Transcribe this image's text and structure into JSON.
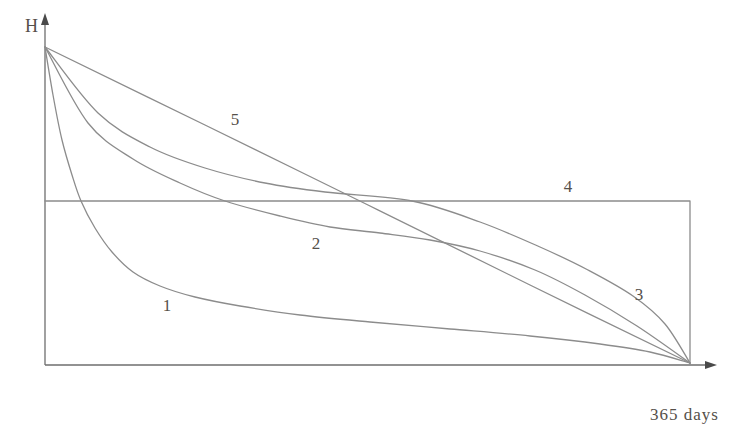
{
  "chart_data": {
    "type": "line",
    "title": "",
    "xlabel": "365 days",
    "ylabel": "H",
    "x_axis": {
      "label": "365 days",
      "range_days": [
        0,
        365
      ],
      "ticks": [],
      "arrow": true
    },
    "y_axis": {
      "label": "H",
      "ticks": [],
      "arrow": true
    },
    "grid": false,
    "legend": "none",
    "colors": {
      "curve": "#8c8c8c",
      "axis": "#6e6e6e",
      "arrowhead": "#4a4a4a",
      "text": "#55504a",
      "background": "#ffffff"
    },
    "geometry_px": {
      "origin": [
        45,
        365
      ],
      "x_axis_end": [
        708,
        365
      ],
      "x_arrow_tip": [
        717,
        365
      ],
      "y_axis_end": [
        45,
        22
      ],
      "y_arrow_tip": [
        45,
        13
      ],
      "common_start_point": [
        45,
        47
      ],
      "common_end_point": [
        690,
        363
      ],
      "plot_right_edge_x": 690,
      "note_mapping": "x axis spans 0 to 365 days between px 45 and px 690; H decreases downward from start px y=47 to axis y=365"
    },
    "curves": [
      {
        "label": "1",
        "kind": "spline",
        "label_pos": [
          167,
          305
        ],
        "points_px": [
          [
            45,
            47
          ],
          [
            53,
            95
          ],
          [
            62,
            140
          ],
          [
            72,
            175
          ],
          [
            81,
            201
          ],
          [
            95,
            228
          ],
          [
            112,
            252
          ],
          [
            133,
            272
          ],
          [
            160,
            286
          ],
          [
            195,
            297
          ],
          [
            240,
            306
          ],
          [
            300,
            315
          ],
          [
            370,
            322
          ],
          [
            450,
            329
          ],
          [
            530,
            336
          ],
          [
            600,
            344
          ],
          [
            650,
            352
          ],
          [
            690,
            363
          ]
        ]
      },
      {
        "label": "2",
        "kind": "spline",
        "label_pos": [
          316,
          243
        ],
        "points_px": [
          [
            45,
            47
          ],
          [
            88,
            123
          ],
          [
            133,
            159
          ],
          [
            180,
            183
          ],
          [
            225,
            201
          ],
          [
            280,
            216
          ],
          [
            330,
            227
          ],
          [
            380,
            233
          ],
          [
            430,
            240
          ],
          [
            480,
            251
          ],
          [
            535,
            270
          ],
          [
            585,
            295
          ],
          [
            637,
            326
          ],
          [
            690,
            363
          ]
        ]
      },
      {
        "label": "3",
        "kind": "spline",
        "label_pos": [
          639,
          294
        ],
        "points_px": [
          [
            45,
            47
          ],
          [
            98,
            113
          ],
          [
            150,
            147
          ],
          [
            205,
            168
          ],
          [
            265,
            183
          ],
          [
            325,
            192
          ],
          [
            412,
            201
          ],
          [
            480,
            222
          ],
          [
            540,
            247
          ],
          [
            588,
            270
          ],
          [
            633,
            296
          ],
          [
            665,
            324
          ],
          [
            690,
            363
          ]
        ]
      },
      {
        "label": "4",
        "kind": "polyline",
        "label_pos": [
          568,
          186
        ],
        "points_px": [
          [
            45,
            201
          ],
          [
            690,
            201
          ],
          [
            690,
            364
          ]
        ]
      },
      {
        "label": "5",
        "kind": "spline",
        "label_pos": [
          235,
          119
        ],
        "points_px": [
          [
            45,
            47
          ],
          [
            205,
            125
          ],
          [
            368,
            205
          ],
          [
            530,
            285
          ],
          [
            690,
            363
          ]
        ]
      }
    ]
  }
}
